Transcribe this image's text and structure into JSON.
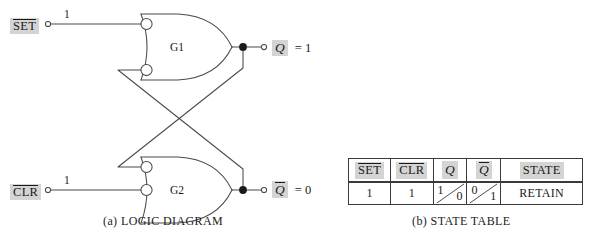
{
  "figure": {
    "background_color": "#ffffff",
    "line_color": "#4a4a4a",
    "highlight_color": "#d4d4d4"
  },
  "logic_diagram": {
    "caption": "(a)  LOGIC DIAGRAM",
    "inputs": [
      {
        "name": "SET",
        "overbar": true,
        "value": "1"
      },
      {
        "name": "CLR",
        "overbar": true,
        "value": "1"
      }
    ],
    "gates": [
      {
        "id": "G1",
        "type": "nor-gate",
        "label": "G1"
      },
      {
        "id": "G2",
        "type": "nor-gate",
        "label": "G2"
      }
    ],
    "outputs": [
      {
        "name": "Q",
        "overbar": false,
        "equals": "= 1",
        "value": "1"
      },
      {
        "name": "Q",
        "overbar": true,
        "equals": "= 0",
        "value": "0"
      }
    ]
  },
  "state_table": {
    "caption": "(b)  STATE TABLE",
    "columns": [
      {
        "key": "set",
        "label": "SET",
        "overbar": true,
        "italic": false,
        "highlight": true
      },
      {
        "key": "clr",
        "label": "CLR",
        "overbar": true,
        "italic": false,
        "highlight": true
      },
      {
        "key": "q",
        "label": "Q",
        "overbar": false,
        "italic": true,
        "highlight": true
      },
      {
        "key": "qnot",
        "label": "Q",
        "overbar": true,
        "italic": true,
        "highlight": true
      },
      {
        "key": "state",
        "label": "STATE",
        "overbar": false,
        "italic": false,
        "highlight": true
      }
    ],
    "rows": [
      {
        "set": "1",
        "clr": "1",
        "q_top": "1",
        "q_bottom": "0",
        "qnot_top": "0",
        "qnot_bottom": "1",
        "state": "RETAIN"
      }
    ]
  }
}
